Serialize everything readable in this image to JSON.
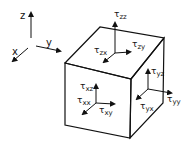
{
  "axes": {
    "x": "x",
    "y": "y",
    "z": "z"
  },
  "labels": {
    "tau": "τ",
    "zz": "zz",
    "zx": "zx",
    "zy": "zy",
    "xz": "xz",
    "xx": "xx",
    "xy": "xy",
    "yz": "yz",
    "yx": "yx",
    "yy": "yy"
  },
  "colors": {
    "stroke": "#111111",
    "background": "#ffffff"
  }
}
